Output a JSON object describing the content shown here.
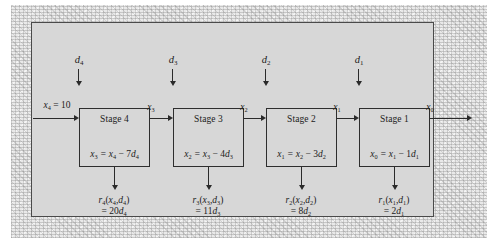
{
  "figure": {
    "type": "serial-multistage-decision-process-diagram",
    "panel_color": "#d7d7d7",
    "line_color": "#2a2a2a",
    "frame_color": "#e9e9e9"
  },
  "input": {
    "label_html": "x<sub>4</sub> <span class=\"up\">= 10</span>",
    "label_text": "x4 = 10",
    "variable": "x4",
    "value": 10
  },
  "output": {
    "label_html": "x<sub>0</sub>",
    "label_text": "x0",
    "variable": "x0"
  },
  "stages": [
    {
      "title": "Stage 4",
      "decision_html": "d<sub>4</sub>",
      "decision_text": "d4",
      "equation_html": "x<sub>3</sub> = x<sub>4</sub> <span class=\"up\">&#8722; 7</span>d<sub>4</sub>",
      "equation_text": "x3 = x4 - 7d4",
      "output_state_html": "x<sub>3</sub>",
      "output_state_text": "x3",
      "reward_name_html": "r<sub>4</sub><span class=\"up\">(</span>x<sub>4</sub><span class=\"up\">,</span>d<sub>4</sub><span class=\"up\">)</span>",
      "reward_name_text": "r4(x4,d4)",
      "reward_value_html": "<span class=\"up\">= 20</span>d<sub>4</sub>",
      "reward_value_text": "= 20d4",
      "coefficient": 20,
      "state_coefficient": 7
    },
    {
      "title": "Stage 3",
      "decision_html": "d<sub>3</sub>",
      "decision_text": "d3",
      "equation_html": "x<sub>2</sub> = x<sub>3</sub> <span class=\"up\">&#8722; 4</span>d<sub>3</sub>",
      "equation_text": "x2 = x3 - 4d3",
      "output_state_html": "x<sub>2</sub>",
      "output_state_text": "x2",
      "reward_name_html": "r<sub>3</sub><span class=\"up\">(</span>x<sub>3</sub><span class=\"up\">,</span>d<sub>3</sub><span class=\"up\">)</span>",
      "reward_name_text": "r3(x3,d3)",
      "reward_value_html": "<span class=\"up\">= 11</span>d<sub>3</sub>",
      "reward_value_text": "= 11d3",
      "coefficient": 11,
      "state_coefficient": 4
    },
    {
      "title": "Stage 2",
      "decision_html": "d<sub>2</sub>",
      "decision_text": "d2",
      "equation_html": "x<sub>1</sub> = x<sub>2</sub> <span class=\"up\">&#8722; 3</span>d<sub>2</sub>",
      "equation_text": "x1 = x2 - 3d2",
      "output_state_html": "x<sub>1</sub>",
      "output_state_text": "x1",
      "reward_name_html": "r<sub>2</sub><span class=\"up\">(</span>x<sub>2</sub><span class=\"up\">,</span>d<sub>2</sub><span class=\"up\">)</span>",
      "reward_name_text": "r2(x2,d2)",
      "reward_value_html": "<span class=\"up\">= 8</span>d<sub>2</sub>",
      "reward_value_text": "= 8d2",
      "coefficient": 8,
      "state_coefficient": 3
    },
    {
      "title": "Stage 1",
      "decision_html": "d<sub>1</sub>",
      "decision_text": "d1",
      "equation_html": "x<sub>0</sub> = x<sub>1</sub> <span class=\"up\">&#8722; 1</span>d<sub>1</sub>",
      "equation_text": "x0 = x1 - 1d1",
      "output_state_html": "x<sub>0</sub>",
      "output_state_text": "x0",
      "reward_name_html": "r<sub>1</sub><span class=\"up\">(</span>x<sub>1</sub><span class=\"up\">,</span>d<sub>1</sub><span class=\"up\">)</span>",
      "reward_name_text": "r1(x1,d1)",
      "reward_value_html": "<span class=\"up\">= 2</span>d<sub>1</sub>",
      "reward_value_text": "= 2d1",
      "coefficient": 2,
      "state_coefficient": 1
    }
  ]
}
